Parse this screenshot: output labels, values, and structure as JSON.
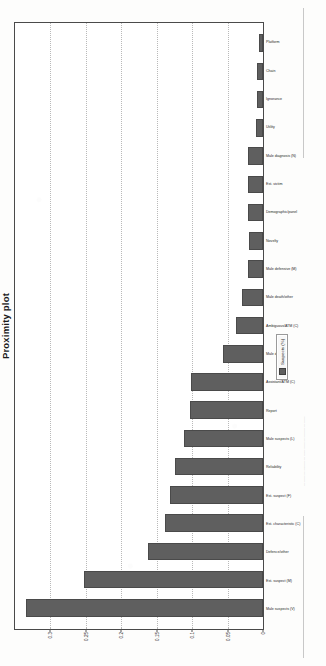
{
  "chart_data": {
    "type": "bar",
    "title": "Proximity plot",
    "xlabel": "",
    "ylabel": "",
    "ylim": [
      0,
      0.35
    ],
    "yticks": [
      0,
      0.05,
      0.1,
      0.15,
      0.2,
      0.25,
      0.3
    ],
    "ytick_labels": [
      "0",
      "0.05",
      "0.1",
      "0.15",
      "0.2",
      "0.25",
      "0.3"
    ],
    "grid": true,
    "grid_style": "dotted-horizontal",
    "legend_position": "right-outside",
    "legend": [
      "Suspects (%)"
    ],
    "series": [
      {
        "name": "Suspects (%)",
        "color": "#5f5f5f",
        "values": [
          0.335,
          0.252,
          0.163,
          0.139,
          0.131,
          0.124,
          0.112,
          0.103,
          0.102,
          0.056,
          0.038,
          0.029,
          0.021,
          0.02,
          0.021,
          0.021,
          0.021,
          0.01,
          0.009,
          0.009,
          0.006
        ]
      }
    ],
    "categories": [
      "Male suspects (V)",
      "Est. suspect (M)",
      "Defence/other",
      "Est. characteristic (C)",
      "Est. suspect (F)",
      "Reliability",
      "Male suspects (L)",
      "Report",
      "Assistant/ATM (C)",
      "Male death",
      "Ambiguous/ATM (C)",
      "Male death/other",
      "Male defensive (M)",
      "Novelty",
      "Demographic/panel",
      "Est. victim",
      "Male diagnosis (N)",
      "Utility",
      "Ignorance",
      "Chain",
      "Platform"
    ]
  },
  "page": {
    "bleed_text": "reverse-side print bleed"
  }
}
